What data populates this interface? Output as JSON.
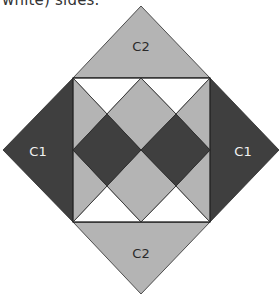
{
  "caption": {
    "text": "white) sides."
  },
  "colors": {
    "light_gray": "#b4b4b4",
    "dark_gray": "#3f3f3f",
    "white": "#ffffff",
    "stroke": "#2a2a2a"
  },
  "diagram": {
    "outer_regions": [
      {
        "id": "top",
        "label": "C2",
        "color": "light_gray"
      },
      {
        "id": "left",
        "label": "C1",
        "color": "dark_gray"
      },
      {
        "id": "right",
        "label": "C1",
        "color": "dark_gray"
      },
      {
        "id": "bottom",
        "label": "C2",
        "color": "light_gray"
      }
    ],
    "inner_square": {
      "white_triangles": 4,
      "light_gray_pieces": 5,
      "dark_diamonds": 2
    }
  }
}
